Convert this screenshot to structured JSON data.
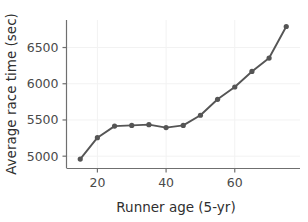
{
  "chart_data": {
    "type": "line",
    "title": "",
    "xlabel": "Runner age (5-yr)",
    "ylabel": "Average race time (sec)",
    "x": [
      15,
      20,
      25,
      30,
      35,
      40,
      45,
      50,
      55,
      60,
      65,
      70,
      75
    ],
    "values": [
      4960,
      5255,
      5415,
      5425,
      5435,
      5395,
      5425,
      5565,
      5785,
      5955,
      6170,
      6355,
      6790
    ],
    "series": [
      {
        "name": "Average race time",
        "values": [
          4960,
          5255,
          5415,
          5425,
          5435,
          5395,
          5425,
          5565,
          5785,
          5955,
          6170,
          6355,
          6790
        ]
      }
    ],
    "xlim": [
      11,
      79
    ],
    "ylim": [
      4830,
      6880
    ],
    "xticks": [
      20,
      40,
      60
    ],
    "xtick_labels": [
      "20",
      "40",
      "60"
    ],
    "yticks": [
      5000,
      5500,
      6000,
      6500
    ],
    "ytick_labels": [
      "5000",
      "5500",
      "6000",
      "6500"
    ],
    "grid": true,
    "grid_axis": "both",
    "legend": false,
    "legend_position": "none",
    "marker": "circle",
    "line_color": "#555555",
    "marker_color": "#555555",
    "grid_color": "#f2f2f2",
    "axis_color": "#6f6f6f",
    "background_color": "#ffffff"
  }
}
